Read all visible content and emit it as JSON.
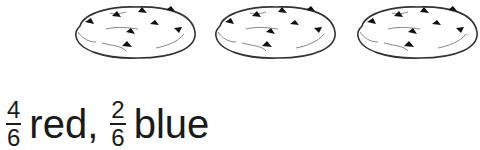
{
  "illustration": {
    "count": 3,
    "items": [
      {
        "label": "cookie-1"
      },
      {
        "label": "cookie-2"
      },
      {
        "label": "cookie-3"
      }
    ],
    "outline_color": "#333333",
    "chip_color": "#111111"
  },
  "caption": {
    "fraction_1": {
      "numerator": "4",
      "denominator": "6"
    },
    "word_1": "red,",
    "fraction_2": {
      "numerator": "2",
      "denominator": "6"
    },
    "word_2": "blue"
  }
}
